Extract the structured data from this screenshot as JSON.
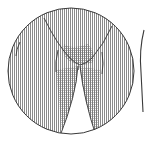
{
  "illustration": {
    "subject": "garment-detail-inset",
    "description": "Circular magnified inset of crotch and upper leg area with vertical line hatching",
    "colors": {
      "background": "#ffffff",
      "outline": "#3a3a3a",
      "hatch": "#8a8a8a",
      "hatch_dense": "#6e6e6e"
    },
    "inset": {
      "cx": 71,
      "cy": 71,
      "r": 63
    },
    "partial_figure_edge": {
      "x": 142,
      "y_start": 30,
      "y_end": 112
    }
  }
}
